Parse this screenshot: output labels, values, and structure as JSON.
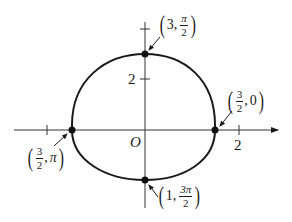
{
  "figure": {
    "curve": "r = 3/(2 - sin θ) ellipse (polar)",
    "axis_labels": {
      "origin": "O",
      "x_tick": "2",
      "y_tick": "2"
    },
    "points": [
      {
        "id": "top",
        "r": "3",
        "theta_num": "π",
        "theta_den": "2",
        "label": "(3, π/2)"
      },
      {
        "id": "right",
        "r_num": "3",
        "r_den": "2",
        "theta": "0",
        "label": "(3/2, 0)"
      },
      {
        "id": "left",
        "r_num": "3",
        "r_den": "2",
        "theta": "π",
        "label": "(3/2, π)"
      },
      {
        "id": "bottom",
        "r": "1",
        "theta_num": "3π",
        "theta_den": "2",
        "label": "(1, 3π/2)"
      }
    ],
    "colors": {
      "curve": "#1a1a1a",
      "axes": "#333333"
    }
  }
}
